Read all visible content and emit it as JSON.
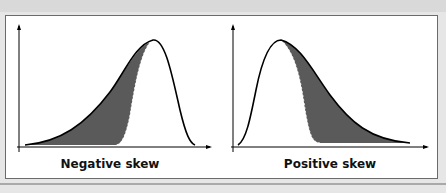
{
  "figure": {
    "left_panel": {
      "caption": "Negative skew"
    },
    "right_panel": {
      "caption": "Positive skew"
    }
  },
  "colors": {
    "shade": "#5a5a5a",
    "curve": "#000000",
    "frame": "#6b6b6b",
    "background": "#e6e6e6"
  }
}
